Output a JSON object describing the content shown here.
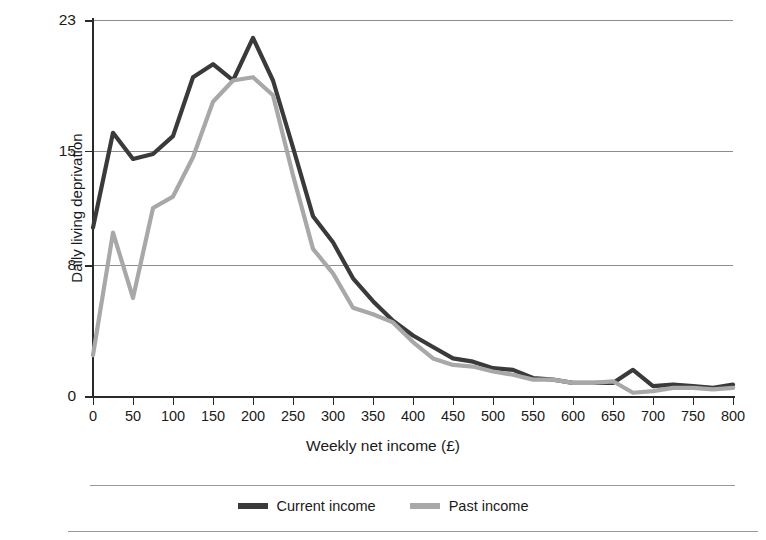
{
  "chart_data": {
    "type": "line",
    "title": "",
    "xlabel": "Weekly net income (£)",
    "ylabel": "Daily living deprivation",
    "xlim": [
      0,
      800
    ],
    "ylim": [
      0,
      23
    ],
    "grid": true,
    "gridlines_y": [
      8,
      15,
      23
    ],
    "yticks": [
      0,
      8,
      15,
      23
    ],
    "ytick_labels": [
      "0",
      "8",
      "15",
      "23"
    ],
    "xticks": [
      0,
      50,
      100,
      150,
      200,
      250,
      300,
      350,
      400,
      450,
      500,
      550,
      600,
      650,
      700,
      750,
      800
    ],
    "xtick_labels": [
      "0",
      "50",
      "100",
      "150",
      "200",
      "250",
      "300",
      "350",
      "400",
      "450",
      "500",
      "550",
      "600",
      "650",
      "700",
      "750",
      "800"
    ],
    "legend_position": "bottom-center",
    "x": [
      0,
      25,
      50,
      75,
      100,
      125,
      150,
      175,
      200,
      225,
      250,
      275,
      300,
      325,
      350,
      375,
      400,
      425,
      450,
      475,
      500,
      525,
      550,
      575,
      600,
      625,
      650,
      675,
      700,
      725,
      750,
      775,
      800
    ],
    "series": [
      {
        "name": "Current income",
        "color": "#3a3a3a",
        "values": [
          10.3,
          16.1,
          14.5,
          14.8,
          15.9,
          19.5,
          20.3,
          19.3,
          21.9,
          19.3,
          15.2,
          11.0,
          9.4,
          7.2,
          5.8,
          4.6,
          3.7,
          3.0,
          2.3,
          2.1,
          1.7,
          1.6,
          1.1,
          1.0,
          0.8,
          0.8,
          0.8,
          1.6,
          0.6,
          0.7,
          0.6,
          0.5,
          0.7
        ]
      },
      {
        "name": "Past income",
        "color": "#a8a8a8",
        "values": [
          2.5,
          10.0,
          6.0,
          11.5,
          12.2,
          14.6,
          18.0,
          19.3,
          19.5,
          18.4,
          13.5,
          9.0,
          7.5,
          5.4,
          5.0,
          4.5,
          3.3,
          2.3,
          1.9,
          1.8,
          1.5,
          1.3,
          1.0,
          1.0,
          0.8,
          0.8,
          0.9,
          0.2,
          0.3,
          0.5,
          0.5,
          0.4,
          0.5
        ]
      }
    ]
  },
  "legend": {
    "items": [
      {
        "label": "Current income",
        "color": "#3a3a3a"
      },
      {
        "label": "Past income",
        "color": "#a8a8a8"
      }
    ]
  },
  "axes": {
    "y_title": "Daily living deprivation",
    "x_title": "Weekly net income (£)"
  }
}
